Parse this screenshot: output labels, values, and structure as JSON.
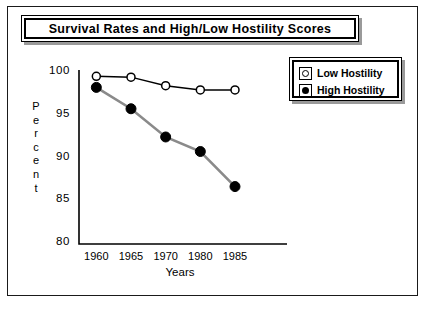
{
  "title": "Survival  Rates  and  High/Low  Hostility  Scores",
  "legend": {
    "entries": [
      {
        "label": "Low  Hostility",
        "marker": "open-circle-icon"
      },
      {
        "label": "High  Hostility",
        "marker": "filled-circle-icon"
      }
    ]
  },
  "axes": {
    "y_label_letters": [
      "P",
      "e",
      "r",
      "c",
      "e",
      "n",
      "t"
    ],
    "y_label": "Percent",
    "y_ticks": [
      "100",
      "95",
      "90",
      "85",
      "80"
    ],
    "x_label": "Years",
    "x_ticks": [
      "1960",
      "1965",
      "1970",
      "1980",
      "1985"
    ]
  },
  "colors": {
    "low_hostility_line": "#000000",
    "high_hostility_line": "#8a8a8a",
    "frame": "#1a1a1a",
    "shadow": "#9a9a9a"
  },
  "chart_data": {
    "type": "line",
    "title": "Survival Rates and High/Low Hostility Scores",
    "xlabel": "Years",
    "ylabel": "Percent",
    "categories": [
      "1960",
      "1965",
      "1970",
      "1980",
      "1985"
    ],
    "ylim": [
      80,
      100
    ],
    "yticks": [
      80,
      85,
      90,
      95,
      100
    ],
    "grid": false,
    "legend_position": "top-right",
    "series": [
      {
        "name": "Low Hostility",
        "marker": "open-circle",
        "line_color": "#000000",
        "values": [
          99.5,
          99.4,
          98.4,
          97.9,
          97.9
        ]
      },
      {
        "name": "High Hostility",
        "marker": "filled-circle",
        "line_color": "#8a8a8a",
        "values": [
          98.2,
          95.7,
          92.4,
          90.7,
          86.6
        ]
      }
    ]
  }
}
